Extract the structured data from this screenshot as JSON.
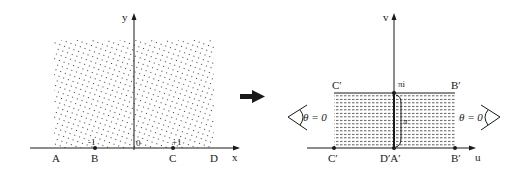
{
  "left_plane": {
    "x_axis_label": "x",
    "y_axis_label": "y",
    "origin_label": "0",
    "tick_minus_one": "-1",
    "tick_plus_one": "+1",
    "points": [
      "A",
      "B",
      "C",
      "D"
    ]
  },
  "arrow": "mapping-arrow",
  "right_plane": {
    "u_axis_label": "u",
    "v_axis_label": "v",
    "top_center_label": "πi",
    "height_label": "π",
    "top_left_label": "C′",
    "top_right_label": "B′",
    "bottom_left_label": "C′",
    "bottom_center_label": "D′A′",
    "bottom_right_label": "B′",
    "left_angle_label": "θ = 0",
    "right_angle_label": "θ = 0"
  },
  "colors": {
    "ink": "#1a1a1a",
    "background": "#ffffff"
  }
}
